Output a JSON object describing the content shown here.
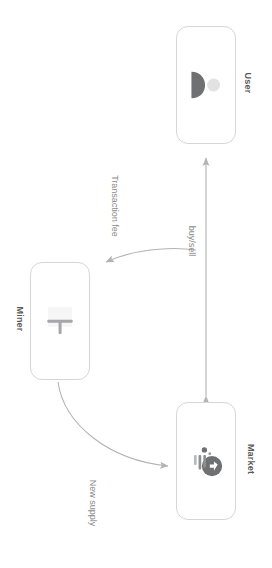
{
  "diagram": {
    "orientation": "rotated-90",
    "background_color": "#ffffff",
    "nodes": [
      {
        "id": "user",
        "label": "User",
        "icon": "person-icon",
        "icon_color": "#6e7072",
        "border_color": "#d6d6d6",
        "fill_color": "#ffffff"
      },
      {
        "id": "miner",
        "label": "Miner",
        "icon": "pickaxe-icon",
        "icon_color": "#6e7072",
        "border_color": "#d6d6d6",
        "fill_color": "#ffffff"
      },
      {
        "id": "market",
        "label": "Market",
        "icon": "globe-exchange-icon",
        "icon_color": "#6e7072",
        "border_color": "#d6d6d6",
        "fill_color": "#ffffff"
      }
    ],
    "edges": [
      {
        "id": "transaction-fee",
        "label": "Transaction fee",
        "from": "user",
        "to": "miner",
        "style": "curved",
        "arrowheads": "end",
        "color": "#b3b3b3"
      },
      {
        "id": "buy-sell",
        "label": "buy/sell",
        "from": "market",
        "to": "user",
        "style": "straight",
        "arrowheads": "both",
        "color": "#b3b3b3"
      },
      {
        "id": "new-supply",
        "label": "New supply",
        "from": "miner",
        "to": "market",
        "style": "curved",
        "arrowheads": "end",
        "color": "#b3b3b3"
      }
    ]
  }
}
